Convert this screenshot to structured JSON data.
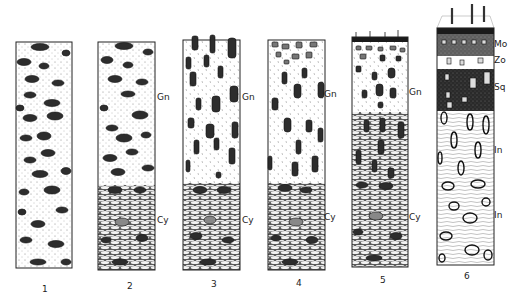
{
  "figure": {
    "columns": [
      {
        "number": "1",
        "labels": []
      },
      {
        "number": "2",
        "labels": [
          {
            "text": "Gn",
            "y": 97
          },
          {
            "text": "Cy",
            "y": 220
          }
        ]
      },
      {
        "number": "3",
        "labels": [
          {
            "text": "Gn",
            "y": 97
          },
          {
            "text": "Cy",
            "y": 220
          }
        ]
      },
      {
        "number": "4",
        "labels": [
          {
            "text": "Gn",
            "y": 94
          },
          {
            "text": "Cy",
            "y": 217
          }
        ]
      },
      {
        "number": "5",
        "labels": [
          {
            "text": "Gn",
            "y": 92
          },
          {
            "text": "Cy",
            "y": 217
          }
        ]
      },
      {
        "number": "6",
        "labels": [
          {
            "text": "Mo",
            "y": 44
          },
          {
            "text": "Zo",
            "y": 60
          },
          {
            "text": "Sq",
            "y": 87
          },
          {
            "text": "In",
            "y": 150
          },
          {
            "text": "In",
            "y": 215
          }
        ]
      }
    ]
  },
  "colors": {
    "ink": "#1a1a1a",
    "paper": "#ffffff",
    "fill_dark": "#3a3a3a"
  }
}
